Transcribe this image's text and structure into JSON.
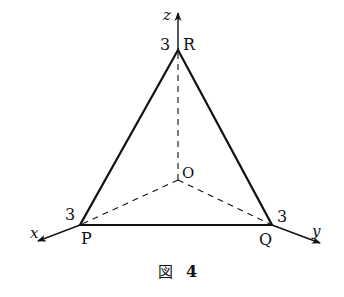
{
  "figure": {
    "caption": "図 4",
    "caption_kanji": "図",
    "caption_number": "4"
  },
  "axes": {
    "x": {
      "label": "x"
    },
    "y": {
      "label": "y"
    },
    "z": {
      "label": "z"
    }
  },
  "points": {
    "origin": {
      "label": "O"
    },
    "P": {
      "label": "P",
      "intercept": "3"
    },
    "Q": {
      "label": "Q",
      "intercept": "3"
    },
    "R": {
      "label": "R",
      "intercept": "3"
    }
  },
  "colors": {
    "stroke": "#111111",
    "background": "#ffffff"
  }
}
